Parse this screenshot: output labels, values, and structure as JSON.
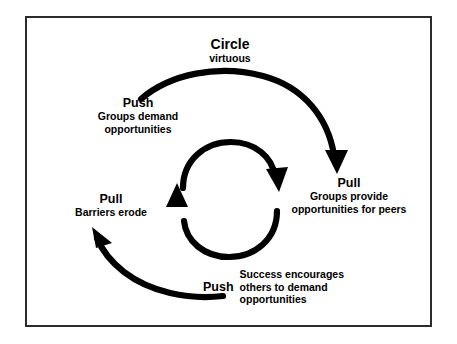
{
  "figure": {
    "title_main": "Circle",
    "title_sub": "virtuous",
    "frame_color": "#2b2b2b",
    "arrow_color": "#000000",
    "background": "#ffffff"
  },
  "stages": [
    {
      "id": "push-demand",
      "kind": "Push",
      "lines": [
        "Groups demand",
        "opportunities"
      ]
    },
    {
      "id": "pull-provide",
      "kind": "Pull",
      "lines": [
        "Groups provide",
        "opportunities for peers"
      ]
    },
    {
      "id": "pull-barriers",
      "kind": "Pull",
      "lines": [
        "Barriers erode"
      ]
    },
    {
      "id": "push-success",
      "kind": "Push",
      "lines": [
        "Success encourages",
        "others to demand",
        "opportunities"
      ]
    }
  ],
  "arrows": [
    {
      "id": "outer-top-arc",
      "from": "push-demand",
      "to": "pull-provide",
      "direction": "clockwise"
    },
    {
      "id": "outer-bottom-arc",
      "from": "push-success",
      "to": "pull-barriers",
      "direction": "clockwise"
    },
    {
      "id": "inner-top-arc",
      "from": "inner-left",
      "to": "inner-right",
      "direction": "clockwise"
    },
    {
      "id": "inner-bottom-arc",
      "from": "inner-right",
      "to": "inner-left",
      "direction": "clockwise"
    }
  ]
}
